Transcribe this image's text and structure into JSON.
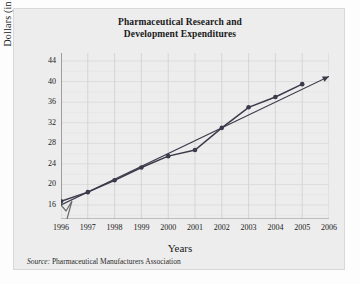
{
  "chart_data": {
    "type": "line",
    "title": "Pharmaceutical Research and Development Expenditures",
    "title_line1": "Pharmaceutical Research and",
    "title_line2": "Development Expenditures",
    "xlabel": "Years",
    "ylabel": "Dollars (in billions)",
    "source_prefix": "Source:",
    "source_text": " Pharmaceutical Manufacturers Association",
    "x": [
      1996,
      1997,
      1998,
      1999,
      2000,
      2001,
      2002,
      2003,
      2004,
      2005,
      2006
    ],
    "categories": [
      "1996",
      "1997",
      "1998",
      "1999",
      "2000",
      "2001",
      "2002",
      "2003",
      "2004",
      "2005",
      "2006"
    ],
    "yticks": [
      16,
      20,
      24,
      28,
      32,
      36,
      40,
      44
    ],
    "xlim": [
      1996,
      2006
    ],
    "ylim": [
      15,
      44
    ],
    "grid": true,
    "legend": "none",
    "axis_break_y": true,
    "series": [
      {
        "name": "R&D expenditures",
        "marker": "circle",
        "color": "#3a3a4a",
        "values": [
          16.7,
          18.5,
          20.8,
          23.3,
          25.5,
          26.7,
          31.0,
          35.0,
          37.0,
          39.5,
          null
        ]
      },
      {
        "name": "Trend line",
        "marker": "none",
        "arrow": true,
        "color": "#3a3a4a",
        "x": [
          1996,
          2006
        ],
        "values": [
          16.0,
          41.0
        ]
      }
    ]
  }
}
